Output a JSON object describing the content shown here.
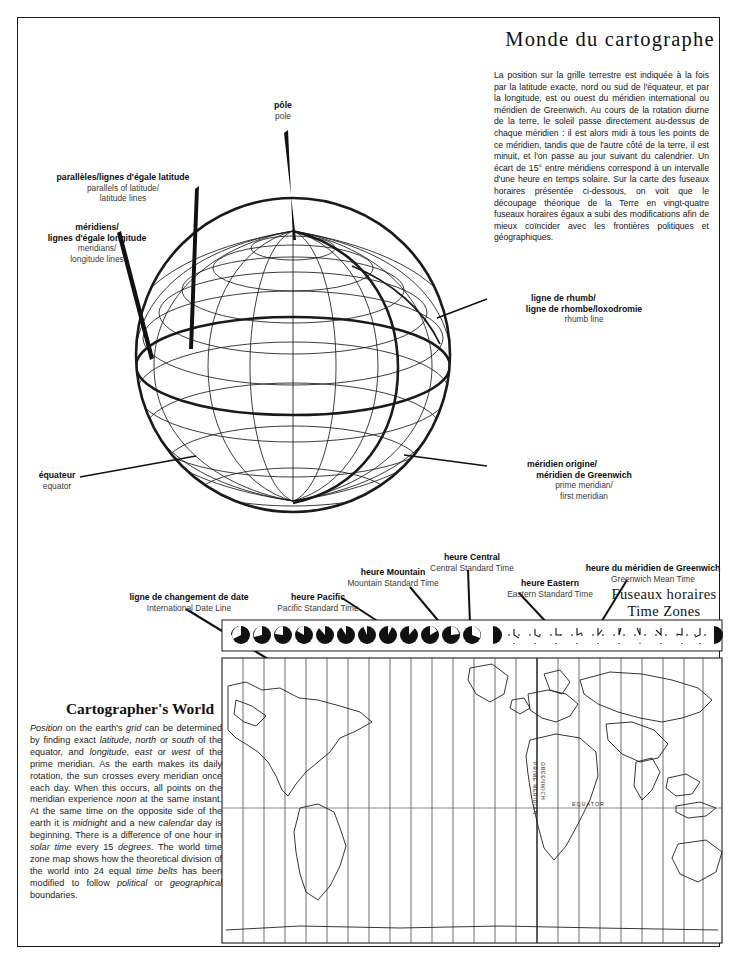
{
  "page": {
    "title_fr": "Monde du cartographe",
    "title_en": "Cartographer's World"
  },
  "french_intro": "La position sur la grille terrestre est indiquée à la fois par la latitude exacte, nord ou sud de l'équateur, et par la longitude, est ou ouest du méridien international ou méridien de Greenwich. Au cours de la rotation diurne de la terre, le soleil passe directement au-dessus de chaque méridien : il est alors midi à tous les points de ce méridien, tandis que de l'autre côté de la terre, il est minuit, et l'on passe au jour suivant du calendrier. Un écart de 15° entre méridiens correspond à un intervalle d'une heure en temps solaire. Sur la carte des fuseaux horaires présentée ci-dessous, on voit que le découpage théorique de la Terre en vingt-quatre fuseaux horaires égaux a subi des modifications afin de mieux coïncider avec les frontières politiques et géographiques.",
  "english_intro_html": "<i>Position</i> on the earth's <i>grid</i> can be determined by finding exact <i>latitude</i>, <i>north</i> or <i>south</i> of the equator, and <i>longitude</i>, <i>east</i> or <i>west</i> of the prime meridian. As the earth makes its daily rotation, the sun crosses every meridian once each day. When this occurs, all points on the meridian experience <i>noon</i> at the same instant. At the same time on the opposite side of the earth it is <i>midnight</i> and a new <i>calendar</i> day is beginning. There is a difference of one hour in <i>solar time</i> every 15 <i>degrees</i>. The world time zone map shows how the theoretical division of the world into 24 equal <i>time belts</i> has been modified to follow <i>political</i> or <i>geographical</i> boundaries.",
  "globe_labels": {
    "pole": {
      "fr": "pôle",
      "en": "pole"
    },
    "parallels": {
      "fr": "parallèles/lignes d'égale latitude",
      "en1": "parallels of latitude/",
      "en2": "latitude lines"
    },
    "meridians": {
      "fr1": "méridiens/",
      "fr2": "lignes d'égale longitude",
      "en1": "meridians/",
      "en2": "longitude lines"
    },
    "rhumb": {
      "fr1": "ligne de rhumb/",
      "fr2": "ligne de rhombe/loxodromie",
      "en": "rhumb line"
    },
    "prime_meridian": {
      "fr1": "méridien origine/",
      "fr2": "méridien de Greenwich",
      "en1": "prime meridian/",
      "en2": "first meridian"
    },
    "equator": {
      "fr": "équateur",
      "en": "equator"
    }
  },
  "timezone_section": {
    "heading_fr": "Fuseaux horaires",
    "heading_en": "Time Zones",
    "labels": [
      {
        "fr": "ligne de changement de date",
        "en": "International Date Line"
      },
      {
        "fr": "heure Pacific",
        "en": "Pacific Standard Time"
      },
      {
        "fr": "heure Mountain",
        "en": "Mountain Standard Time"
      },
      {
        "fr": "heure Central",
        "en": "Central Standard Time"
      },
      {
        "fr": "heure Eastern",
        "en": "Eastern Standard Time"
      },
      {
        "fr": "heure du méridien de Greenwich",
        "en": "Greenwich Mean Time"
      }
    ]
  },
  "map_annotations": {
    "equator": "EQUATOR",
    "prime_meridian": "PRIME MERIDIAN",
    "greenwich": "GREENWICH"
  },
  "colors": {
    "ink": "#1a1a1a",
    "secondary_text": "#3a3a3a",
    "paper": "#ffffff"
  }
}
